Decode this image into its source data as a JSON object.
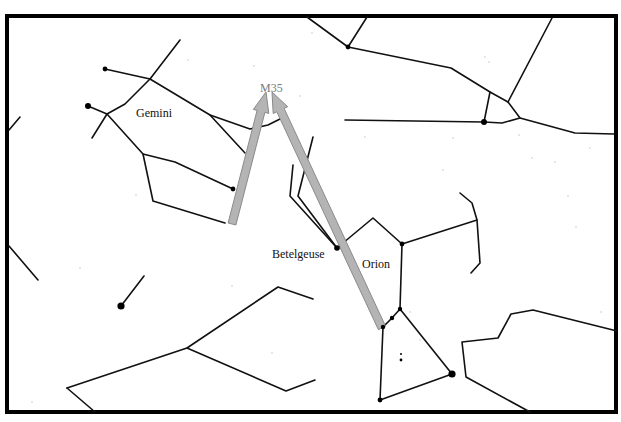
{
  "chart_title": "Star chart: Gemini and Orion with arrows pointing to M35",
  "colors": {
    "background": "#ffffff",
    "frame": "#000000",
    "lines": "#111111",
    "arrow_fill": "#b4b4b4",
    "arrow_stroke": "#8a8a8a",
    "m35_label": "#7a7a7a"
  },
  "frame": {
    "x": 7,
    "y": 16,
    "width": 609,
    "height": 396
  },
  "labels": {
    "gemini": {
      "text": "Gemini",
      "x": 136,
      "y": 117
    },
    "m35": {
      "text": "M35",
      "x": 260,
      "y": 92
    },
    "betelgeuse": {
      "text": "Betelgeuse",
      "x": 272,
      "y": 258
    },
    "orion": {
      "text": "Orion",
      "x": 362,
      "y": 268
    }
  },
  "arrows": [
    {
      "name": "arrow-left-to-m35",
      "from": [
        232,
        224
      ],
      "to": [
        266,
        92
      ]
    },
    {
      "name": "arrow-right-to-m35",
      "from": [
        382,
        328
      ],
      "to": [
        272,
        92
      ]
    }
  ],
  "constellation_lines": [
    {
      "name": "gemini-upper-branch",
      "points": [
        [
          105,
          69
        ],
        [
          150,
          79
        ],
        [
          180,
          40
        ]
      ]
    },
    {
      "name": "gemini-upper-body",
      "points": [
        [
          150,
          79
        ],
        [
          210,
          115
        ],
        [
          250,
          129
        ],
        [
          268,
          125
        ],
        [
          286,
          116
        ]
      ]
    },
    {
      "name": "gemini-arm",
      "points": [
        [
          210,
          115
        ],
        [
          245,
          153
        ]
      ]
    },
    {
      "name": "gemini-left-head",
      "points": [
        [
          88,
          106
        ],
        [
          107,
          114
        ],
        [
          125,
          104
        ],
        [
          150,
          79
        ]
      ]
    },
    {
      "name": "gemini-left-arm",
      "points": [
        [
          107,
          114
        ],
        [
          92,
          138
        ]
      ]
    },
    {
      "name": "gemini-lower-body",
      "points": [
        [
          107,
          114
        ],
        [
          143,
          154
        ],
        [
          175,
          162
        ],
        [
          233,
          189
        ]
      ]
    },
    {
      "name": "gemini-foot",
      "points": [
        [
          143,
          154
        ],
        [
          153,
          201
        ],
        [
          225,
          223
        ]
      ]
    },
    {
      "name": "left-edge-stub-top",
      "points": [
        [
          9,
          130
        ],
        [
          20,
          117
        ]
      ]
    },
    {
      "name": "left-edge-stub-mid",
      "points": [
        [
          9,
          246
        ],
        [
          38,
          280
        ]
      ]
    },
    {
      "name": "top-lines-left",
      "points": [
        [
          307,
          17
        ],
        [
          348,
          47
        ],
        [
          367,
          17
        ]
      ]
    },
    {
      "name": "top-lines-long",
      "points": [
        [
          348,
          47
        ],
        [
          451,
          68
        ],
        [
          490,
          92
        ],
        [
          508,
          102
        ],
        [
          520,
          118
        ],
        [
          575,
          133
        ],
        [
          614,
          134
        ]
      ]
    },
    {
      "name": "top-right-diagonal",
      "points": [
        [
          508,
          102
        ],
        [
          552,
          18
        ]
      ]
    },
    {
      "name": "horizontal-line",
      "points": [
        [
          345,
          120
        ],
        [
          484,
          122
        ],
        [
          502,
          123
        ],
        [
          520,
          118
        ]
      ]
    },
    {
      "name": "short-drop",
      "points": [
        [
          490,
          92
        ],
        [
          484,
          122
        ]
      ]
    },
    {
      "name": "orion-upper-left-a",
      "points": [
        [
          313,
          137
        ],
        [
          298,
          196
        ],
        [
          337,
          248
        ]
      ]
    },
    {
      "name": "orion-upper-left-b",
      "points": [
        [
          293,
          165
        ],
        [
          290,
          196
        ],
        [
          337,
          248
        ]
      ]
    },
    {
      "name": "orion-shoulder",
      "points": [
        [
          337,
          248
        ],
        [
          373,
          218
        ],
        [
          402,
          244
        ],
        [
          477,
          220
        ]
      ]
    },
    {
      "name": "orion-club",
      "points": [
        [
          460,
          193
        ],
        [
          472,
          203
        ],
        [
          477,
          220
        ],
        [
          480,
          263
        ],
        [
          471,
          273
        ]
      ]
    },
    {
      "name": "orion-body-right",
      "points": [
        [
          402,
          244
        ],
        [
          400,
          309
        ]
      ]
    },
    {
      "name": "orion-belt",
      "points": [
        [
          383,
          327
        ],
        [
          392,
          318
        ],
        [
          400,
          309
        ]
      ]
    },
    {
      "name": "orion-lower",
      "points": [
        [
          400,
          309
        ],
        [
          452,
          374
        ],
        [
          380,
          400
        ],
        [
          383,
          327
        ]
      ]
    },
    {
      "name": "lepus-like",
      "points": [
        [
          67,
          388
        ],
        [
          187,
          348
        ],
        [
          278,
          287
        ],
        [
          313,
          299
        ]
      ]
    },
    {
      "name": "lepus-lower",
      "points": [
        [
          187,
          348
        ],
        [
          286,
          391
        ],
        [
          315,
          380
        ]
      ]
    },
    {
      "name": "lepus-tail",
      "points": [
        [
          67,
          388
        ],
        [
          95,
          412
        ]
      ]
    },
    {
      "name": "eridanus-right",
      "points": [
        [
          617,
          331
        ],
        [
          533,
          310
        ],
        [
          511,
          314
        ],
        [
          498,
          338
        ],
        [
          462,
          342
        ],
        [
          466,
          377
        ],
        [
          530,
          412
        ]
      ]
    },
    {
      "name": "single-stub",
      "points": [
        [
          121,
          306
        ],
        [
          144,
          276
        ]
      ]
    }
  ],
  "stars": [
    {
      "name": "castor",
      "x": 88,
      "y": 106,
      "r": 3
    },
    {
      "name": "pollux-area",
      "x": 105,
      "y": 69,
      "r": 2.4
    },
    {
      "name": "gemini-star",
      "x": 233,
      "y": 189,
      "r": 2.4
    },
    {
      "name": "top-star",
      "x": 348,
      "y": 47,
      "r": 2.4
    },
    {
      "name": "horizontal-star",
      "x": 484,
      "y": 122,
      "r": 3
    },
    {
      "name": "betelgeuse",
      "x": 337,
      "y": 248,
      "r": 2.8
    },
    {
      "name": "bellatrix",
      "x": 402,
      "y": 244,
      "r": 2.4
    },
    {
      "name": "belt-1",
      "x": 383,
      "y": 327,
      "r": 2.2
    },
    {
      "name": "belt-2",
      "x": 392,
      "y": 318,
      "r": 2.2
    },
    {
      "name": "belt-3",
      "x": 400,
      "y": 309,
      "r": 2.2
    },
    {
      "name": "rigel",
      "x": 452,
      "y": 374,
      "r": 3.6
    },
    {
      "name": "saiph",
      "x": 380,
      "y": 400,
      "r": 2.4
    },
    {
      "name": "procyon-area",
      "x": 121,
      "y": 306,
      "r": 3.6
    },
    {
      "name": "orion-nebula-1",
      "x": 401,
      "y": 360,
      "r": 1.4
    },
    {
      "name": "orion-nebula-2",
      "x": 401,
      "y": 354,
      "r": 1
    }
  ],
  "specks": [
    [
      254,
      66
    ],
    [
      312,
      33
    ],
    [
      485,
      57
    ],
    [
      489,
      62
    ],
    [
      453,
      138
    ],
    [
      365,
      137
    ],
    [
      568,
      196
    ],
    [
      590,
      148
    ],
    [
      443,
      170
    ],
    [
      555,
      162
    ],
    [
      232,
      286
    ],
    [
      80,
      268
    ],
    [
      32,
      402
    ],
    [
      272,
      353
    ],
    [
      136,
      195
    ],
    [
      300,
      96
    ],
    [
      519,
      135
    ],
    [
      601,
      312
    ],
    [
      420,
      340
    ],
    [
      410,
      312
    ],
    [
      532,
      158
    ],
    [
      576,
      227
    ],
    [
      188,
      60
    ]
  ]
}
